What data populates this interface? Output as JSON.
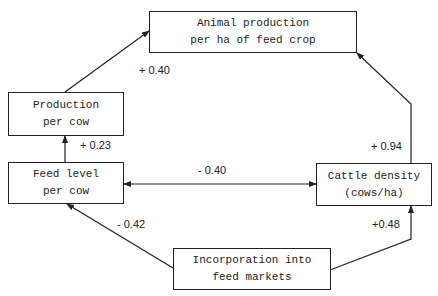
{
  "nodes": {
    "animal_production": {
      "line1": "Animal production",
      "line2": "per ha of feed crop"
    },
    "production_per_cow": {
      "line1": "Production",
      "line2": "per cow"
    },
    "feed_level": {
      "line1": "Feed level",
      "line2": "per cow"
    },
    "cattle_density": {
      "line1": "Cattle density",
      "line2": "(cows/ha)"
    },
    "incorporation": {
      "line1": "Incorporation into",
      "line2": "feed markets"
    }
  },
  "edges": [
    {
      "from": "Production per cow",
      "to": "Animal production per ha of feed crop",
      "label": "+ 0.40"
    },
    {
      "from": "Feed level per cow",
      "to": "Production per cow",
      "label": "+ 0.23"
    },
    {
      "from": "Feed level per cow",
      "to": "Cattle density (cows/ha)",
      "label": "- 0.40",
      "bidirectional": true
    },
    {
      "from": "Cattle density (cows/ha)",
      "to": "Animal production per ha of feed crop",
      "label": "+ 0.94"
    },
    {
      "from": "Incorporation into feed markets",
      "to": "Feed level per cow",
      "label": "- 0.42"
    },
    {
      "from": "Incorporation into feed markets",
      "to": "Cattle density (cows/ha)",
      "label": "+0.48"
    }
  ],
  "colors": {
    "line": "#222222",
    "background": "#ffffff"
  }
}
